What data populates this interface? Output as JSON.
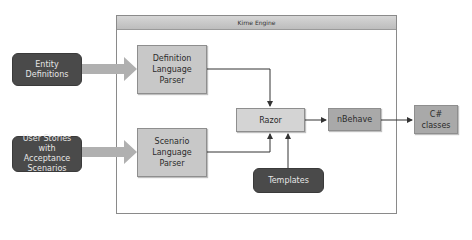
{
  "engine": {
    "title": "Kirne Engine"
  },
  "inputs": [
    {
      "id": "entity-definitions",
      "label": "Entity Definitions"
    },
    {
      "id": "user-stories",
      "label": "User Stories with Acceptance Scenarios"
    }
  ],
  "parsers": [
    {
      "id": "definition-parser",
      "label": "Definition Language Parser"
    },
    {
      "id": "scenario-parser",
      "label": "Scenario Language Parser"
    }
  ],
  "razor": {
    "label": "Razor"
  },
  "nbehave": {
    "label": "nBehave"
  },
  "templates": {
    "label": "Templates"
  },
  "output": {
    "label": "C# classes"
  },
  "colors": {
    "dark_node": "#4a4a4a",
    "process_node": "#c8c8c8",
    "fat_arrow": "#b0b0b0",
    "connector": "#333333"
  }
}
